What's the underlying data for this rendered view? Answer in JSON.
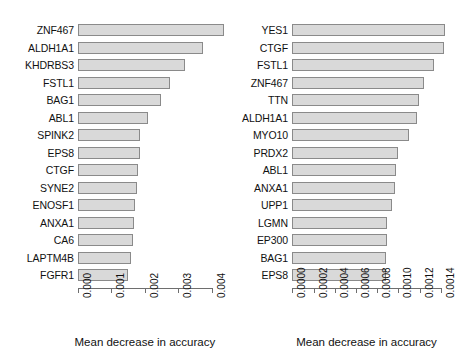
{
  "figure": {
    "type": "multi-panel-bar-chart",
    "panels": 2,
    "bar_fill": "#d9d9d9",
    "bar_stroke": "#8a8a8a",
    "background": "#ffffff"
  },
  "chart_data": [
    {
      "type": "bar",
      "orientation": "horizontal",
      "panel": "left",
      "title": "",
      "xlabel": "Mean decrease in accuracy",
      "ylabel": "",
      "xlim": [
        0,
        0.004
      ],
      "grid": false,
      "legend": null,
      "xticks": [
        0,
        0.001,
        0.002,
        0.003,
        0.004
      ],
      "xticklabels": [
        "0.000",
        "0.001",
        "0.002",
        "0.003",
        "0.004"
      ],
      "categories": [
        "ZNF467",
        "ALDH1A1",
        "KHDRBS3",
        "FSTL1",
        "BAG1",
        "ABL1",
        "SPINK2",
        "EPS8",
        "CTGF",
        "SYNE2",
        "ENOSF1",
        "ANXA1",
        "CA6",
        "LAPTM4B",
        "FGFR1"
      ],
      "values": [
        0.00437,
        0.00374,
        0.0032,
        0.00276,
        0.00249,
        0.0021,
        0.00186,
        0.00184,
        0.0018,
        0.00177,
        0.00172,
        0.00168,
        0.00164,
        0.00158,
        0.0015
      ]
    },
    {
      "type": "bar",
      "orientation": "horizontal",
      "panel": "right",
      "title": "",
      "xlabel": "Mean decrease in accuracy",
      "ylabel": "",
      "xlim": [
        0,
        0.0014
      ],
      "grid": false,
      "legend": null,
      "xticks": [
        0,
        0.0002,
        0.0004,
        0.0006,
        0.0008,
        0.001,
        0.0012,
        0.0014
      ],
      "xticklabels": [
        "0.0000",
        "0.0002",
        "0.0004",
        "0.0006",
        "0.0008",
        "0.0010",
        "0.0012",
        "0.0014"
      ],
      "categories": [
        "YES1",
        "CTGF",
        "FSTL1",
        "ZNF467",
        "TTN",
        "ALDH1A1",
        "MYO10",
        "PRDX2",
        "ABL1",
        "ANXA1",
        "UPP1",
        "LGMN",
        "EP300",
        "BAG1",
        "EPS8"
      ],
      "values": [
        0.00144,
        0.00143,
        0.00134,
        0.001245,
        0.001198,
        0.00118,
        0.0011,
        0.000995,
        0.000978,
        0.000968,
        0.00094,
        0.000893,
        0.00089,
        0.000885,
        0.00088
      ]
    }
  ]
}
